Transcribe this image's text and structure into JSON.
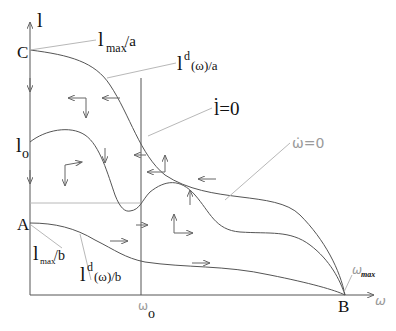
{
  "diagram": {
    "type": "phase-diagram",
    "axes": {
      "y_label": "l",
      "x_label": "ω"
    },
    "points": {
      "C": "C",
      "A": "A",
      "B": "B"
    },
    "labels": {
      "lmax_a_main": "l",
      "lmax_a_sub": "max",
      "lmax_a_tail": "/a",
      "ld_a_main": "l",
      "ld_a_sup": "d",
      "ld_a_tail": "(ω)/a",
      "ldot_zero": "l̇=0",
      "l0_main": "l",
      "l0_sub": "o",
      "omegadot_zero": "ω̇=0",
      "lmax_b_main": "l",
      "lmax_b_sub": "max",
      "lmax_b_tail": "/b",
      "ld_b_main": "l",
      "ld_b_sup": "d",
      "ld_b_tail": "(ω)/b",
      "omega0_main": "ω",
      "omega0_sub": "o",
      "omegamax_main": "ω",
      "omegamax_sub": "max"
    },
    "curves": [
      "l^d(ω)/a upper boundary from C to B",
      "l̇=0 locus (wavy) starting at l_o",
      "l^d(ω)/b lower boundary from A to B",
      "ω̇=0 vertical line at ω_o"
    ]
  }
}
